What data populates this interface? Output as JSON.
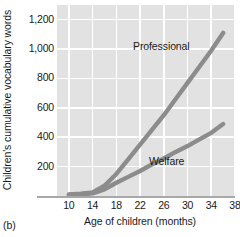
{
  "figure": {
    "panel_letter": "(b)"
  },
  "chart_data": {
    "type": "line",
    "title": "",
    "xlabel": "Age of children (months)",
    "ylabel": "Children's cumulative vocabulary words",
    "xlim": [
      8,
      38
    ],
    "ylim": [
      0,
      1300
    ],
    "grid": true,
    "legend_position": "inline-labels",
    "xticks": [
      "10",
      "14",
      "18",
      "22",
      "26",
      "30",
      "34",
      "38"
    ],
    "xtick_values": [
      10,
      14,
      18,
      22,
      26,
      30,
      34,
      38
    ],
    "yticks": [
      "200",
      "400",
      "600",
      "800",
      "1,000",
      "1,200"
    ],
    "ytick_values": [
      200,
      400,
      600,
      800,
      1000,
      1200
    ],
    "line_color": "#8c8c8c",
    "plot_background": "#e2e2e2",
    "gridline_color": "#ffffff",
    "series": [
      {
        "name": "Professional",
        "label": "Professional",
        "x": [
          10,
          12,
          14,
          16,
          18,
          20,
          22,
          24,
          26,
          28,
          30,
          32,
          34,
          36
        ],
        "values": [
          10,
          15,
          25,
          70,
          150,
          250,
          350,
          450,
          550,
          660,
          770,
          880,
          990,
          1110
        ]
      },
      {
        "name": "Welfare",
        "label": "Welfare",
        "x": [
          10,
          12,
          14,
          16,
          18,
          20,
          22,
          24,
          26,
          28,
          30,
          32,
          34,
          36
        ],
        "values": [
          8,
          10,
          18,
          45,
          90,
          130,
          170,
          215,
          255,
          300,
          340,
          385,
          430,
          490
        ]
      }
    ]
  }
}
